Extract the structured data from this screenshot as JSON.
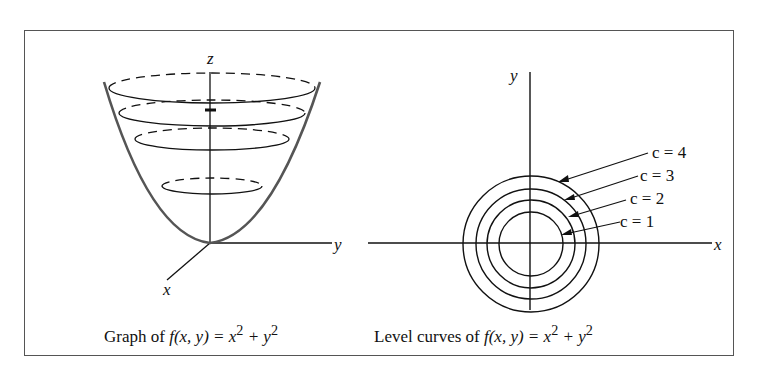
{
  "figure": {
    "left_panel": {
      "axis_labels": {
        "z": "z",
        "y": "y",
        "x": "x"
      },
      "caption_prefix": "Graph of ",
      "caption_function": "f(x, y) = x",
      "caption_exp1": "2",
      "caption_mid": " + y",
      "caption_exp2": "2",
      "caption_full": "Graph of f(x, y) = x^2 + y^2"
    },
    "right_panel": {
      "axis_labels": {
        "y": "y",
        "x": "x"
      },
      "level_labels": [
        "c = 4",
        "c = 3",
        "c = 2",
        "c = 1"
      ],
      "caption_prefix": "Level curves of ",
      "caption_function": "f(x, y) = x",
      "caption_exp1": "2",
      "caption_mid": " + y",
      "caption_exp2": "2",
      "caption_full": "Level curves of f(x, y) = x^2 + y^2"
    },
    "colors": {
      "line": "#111111",
      "surface": "#555555",
      "frame": "#555555"
    }
  }
}
